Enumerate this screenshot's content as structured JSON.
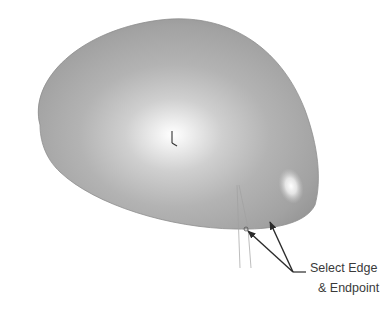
{
  "diagram": {
    "callout": {
      "line1": "Select Edge",
      "line2": "& Endpoint"
    },
    "icons": {
      "triad": "coordinate-triad-icon"
    },
    "colors": {
      "background": "#ffffff",
      "surface_edge": "#8e8e8e",
      "surface_mid": "#b4b4b4",
      "highlight": "#ffffff",
      "arrow": "#2b2b2b",
      "construction_line": "#a0a0a0",
      "text": "#3a3a3a"
    }
  }
}
